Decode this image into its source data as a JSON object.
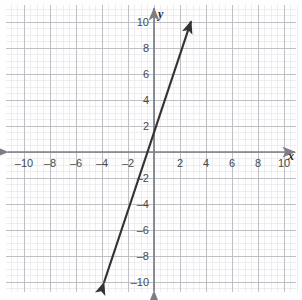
{
  "chart_data": {
    "type": "line",
    "title": "",
    "xlabel": "x",
    "ylabel": "y",
    "xlim": [
      -10.8,
      10.8
    ],
    "ylim": [
      -10.8,
      10.8
    ],
    "grid": true,
    "grid_major_step": 2,
    "grid_minor_step": 0.5,
    "legend": "none",
    "x_ticks": [
      -10,
      -8,
      -6,
      -4,
      -2,
      2,
      4,
      6,
      8,
      10
    ],
    "y_ticks": [
      10,
      8,
      6,
      4,
      2,
      -2,
      -4,
      -6,
      -8,
      -10
    ],
    "x_tick_labels": [
      "–10",
      "–8",
      "–6",
      "–4",
      "–2",
      "2",
      "4",
      "6",
      "8",
      "10"
    ],
    "y_tick_labels": [
      "10",
      "8",
      "6",
      "4",
      "2",
      "–2",
      "–4",
      "–6",
      "–8",
      "–10"
    ],
    "series": [
      {
        "name": "line",
        "slope": 3,
        "intercept": 1.5,
        "x": [
          -3.85,
          2.85
        ],
        "y": [
          -10.05,
          10.05
        ],
        "arrow_start": true,
        "arrow_end": true,
        "color": "#333333"
      }
    ]
  },
  "axes": {
    "x_axis_label": "x",
    "y_axis_label": "y",
    "x_arrow_left": true,
    "x_arrow_right": true,
    "y_arrow_top": true,
    "y_arrow_bottom": true
  },
  "colors": {
    "background": "#fefefe",
    "grid_minor": "#e2e2e6",
    "grid_major": "#b9b9bf",
    "axis": "#7d7d85",
    "line": "#333333",
    "tick_text": "#4a4a4a",
    "axis_name_text": "#2a2a2a"
  }
}
